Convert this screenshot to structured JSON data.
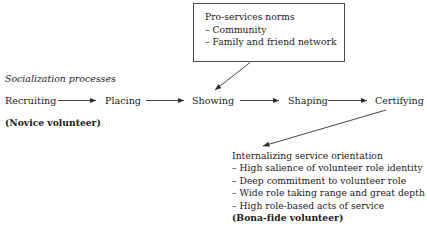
{
  "figure": {
    "background_color": "#ffffff",
    "line_color": "#3a3a3a",
    "text_color": "#1a1a1a"
  },
  "norms_box": {
    "title": "Pro-services norms",
    "items": [
      "– Community",
      "– Family and friend network"
    ]
  },
  "section_label": "Socialization processes",
  "process": {
    "stages": [
      {
        "label": "Recruiting"
      },
      {
        "label": "Placing"
      },
      {
        "label": "Showing"
      },
      {
        "label": "Shaping"
      },
      {
        "label": "Certifying"
      }
    ],
    "start_annotation": "(Novice volunteer)"
  },
  "outcome": {
    "title": "Internalizing service orientation",
    "items": [
      "– High salience of volunteer role identity",
      "– Deep commitment to volunteer role",
      "– Wide role taking range and great depth",
      "– High role-based acts of service"
    ],
    "end_annotation": "(Bona-fide volunteer)"
  },
  "connectors": {
    "recruiting_to_placing": "arrow-right",
    "placing_to_showing": "arrow-right",
    "showing_to_shaping": "arrow-right",
    "shaping_to_certifying": "arrow-right",
    "norms_to_showing": "arrow-diagonal-down-left",
    "certifying_to_outcome": "arrow-diagonal-down-left"
  }
}
